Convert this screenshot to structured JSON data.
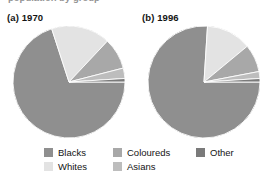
{
  "figure": {
    "clipped_top_caption": "population by group",
    "panels": [
      {
        "id": "a",
        "label": "(a) 1970"
      },
      {
        "id": "b",
        "label": "(b) 1996"
      }
    ]
  },
  "legend": {
    "position": "bottom",
    "items": [
      {
        "key": "blacks",
        "label": "Blacks",
        "color": "#8f8f8f"
      },
      {
        "key": "whites",
        "label": "Whites",
        "color": "#e3e3e3"
      },
      {
        "key": "coloureds",
        "label": "Coloureds",
        "color": "#a8a8a8"
      },
      {
        "key": "asians",
        "label": "Asians",
        "color": "#bdbdbd"
      },
      {
        "key": "other",
        "label": "Other",
        "color": "#7a7a7a"
      }
    ]
  },
  "chart_data": [
    {
      "type": "pie",
      "title": "(a) 1970",
      "panel": "a",
      "categories": [
        "Blacks",
        "Whites",
        "Coloureds",
        "Asians",
        "Other"
      ],
      "values": [
        70,
        17,
        9,
        3,
        1
      ],
      "unit": "percent",
      "colors": [
        "#8f8f8f",
        "#e3e3e3",
        "#a8a8a8",
        "#bdbdbd",
        "#7a7a7a"
      ],
      "start_angle_deg": 0,
      "direction": "clockwise",
      "xlabel": "",
      "ylabel": "",
      "grid": false,
      "legend": "bottom"
    },
    {
      "type": "pie",
      "title": "(b) 1996",
      "panel": "b",
      "categories": [
        "Blacks",
        "Whites",
        "Coloureds",
        "Asians",
        "Other"
      ],
      "values": [
        76,
        13,
        8,
        2,
        1
      ],
      "unit": "percent",
      "colors": [
        "#8f8f8f",
        "#e3e3e3",
        "#a8a8a8",
        "#bdbdbd",
        "#7a7a7a"
      ],
      "start_angle_deg": 0,
      "direction": "clockwise",
      "xlabel": "",
      "ylabel": "",
      "grid": false,
      "legend": "bottom"
    }
  ]
}
